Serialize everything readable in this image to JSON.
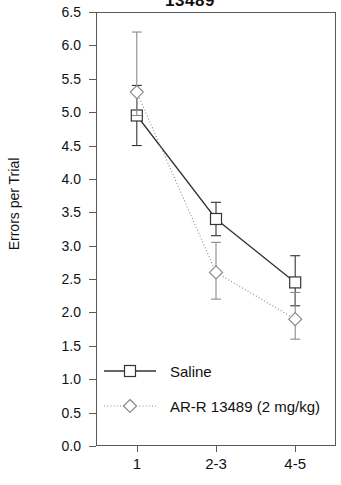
{
  "chart_data": {
    "type": "line",
    "title": "13489",
    "xlabel": "",
    "ylabel": "Errors per Trial",
    "categories": [
      "1",
      "2-3",
      "4-5"
    ],
    "ylim": [
      0.0,
      6.5
    ],
    "ytick_labels": [
      "6.5",
      "6.0",
      "5.5",
      "5.0",
      "4.5",
      "4.0",
      "3.5",
      "3.0",
      "2.5",
      "2.0",
      "1.5",
      "1.0",
      "0.5",
      "0.0"
    ],
    "ytick_values": [
      6.5,
      6.0,
      5.5,
      5.0,
      4.5,
      4.0,
      3.5,
      3.0,
      2.5,
      2.0,
      1.5,
      1.0,
      0.5,
      0.0
    ],
    "grid": false,
    "legend_position": "inside-bottom-left",
    "series": [
      {
        "name": "Saline",
        "marker": "square",
        "line_style": "solid",
        "color": "#333333",
        "values": [
          4.95,
          3.4,
          2.45
        ],
        "err_low": [
          4.5,
          3.15,
          2.1
        ],
        "err_high": [
          5.4,
          3.65,
          2.85
        ]
      },
      {
        "name": "AR-R 13489 (2 mg/kg)",
        "marker": "diamond",
        "line_style": "dotted",
        "color": "#8a8a8a",
        "values": [
          5.3,
          2.6,
          1.9
        ],
        "err_low": [
          4.95,
          2.2,
          1.6
        ],
        "err_high": [
          6.2,
          3.05,
          2.3
        ]
      }
    ]
  },
  "legend": {
    "entries": [
      {
        "label": "Saline"
      },
      {
        "label": "AR-R 13489 (2 mg/kg)"
      }
    ]
  }
}
